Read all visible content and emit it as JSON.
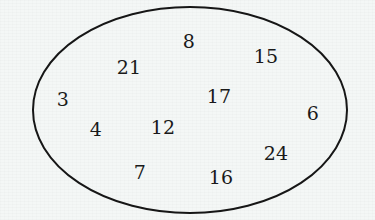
{
  "diagram": {
    "type": "set-ellipse-diagram",
    "title": "",
    "background_color": "#f4f7f6",
    "ellipse": {
      "name": "set-boundary-ellipse",
      "stroke_color": "#161616",
      "fill_color": "none",
      "stroke_width": 2,
      "center_x": 190,
      "center_y": 110,
      "radius_x": 157,
      "radius_y": 103
    },
    "elements": [
      {
        "label": "8",
        "x": 189,
        "y": 41,
        "font_size": 19
      },
      {
        "label": "15",
        "x": 266,
        "y": 56,
        "font_size": 19
      },
      {
        "label": "21",
        "x": 129,
        "y": 67,
        "font_size": 19
      },
      {
        "label": "3",
        "x": 63,
        "y": 99,
        "font_size": 19
      },
      {
        "label": "17",
        "x": 219,
        "y": 96,
        "font_size": 19
      },
      {
        "label": "6",
        "x": 313,
        "y": 113,
        "font_size": 19
      },
      {
        "label": "4",
        "x": 96,
        "y": 129,
        "font_size": 19
      },
      {
        "label": "12",
        "x": 163,
        "y": 127,
        "font_size": 19
      },
      {
        "label": "24",
        "x": 276,
        "y": 153,
        "font_size": 19
      },
      {
        "label": "7",
        "x": 140,
        "y": 172,
        "font_size": 19
      },
      {
        "label": "16",
        "x": 221,
        "y": 177,
        "font_size": 19
      }
    ]
  },
  "chart_data": {
    "type": "table",
    "title": "",
    "xlabel": "",
    "ylabel": "",
    "categories": [
      "8",
      "15",
      "21",
      "3",
      "17",
      "6",
      "4",
      "12",
      "24",
      "7",
      "16"
    ],
    "values": [
      8,
      15,
      21,
      3,
      17,
      6,
      4,
      12,
      24,
      7,
      16
    ],
    "annotations": []
  }
}
